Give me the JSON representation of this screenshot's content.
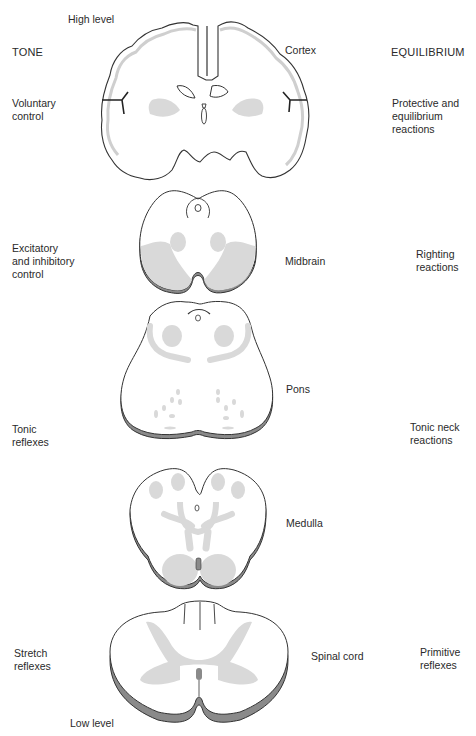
{
  "diagram": {
    "columns": {
      "left_header": "TONE",
      "right_header": "EQUILIBRIUM"
    },
    "axis": {
      "top": "High level",
      "bottom": "Low level"
    },
    "levels": [
      {
        "structure": "Cortex",
        "tone": "Voluntary\ncontrol",
        "equilibrium": "Protective and\nequilibrium\nreactions"
      },
      {
        "structure": "Midbrain",
        "tone": "Excitatory\nand inhibitory\ncontrol",
        "equilibrium": "Righting\nreactions"
      },
      {
        "structure": "Pons",
        "tone": "Tonic\nreflexes",
        "equilibrium": "Tonic neck\nreactions"
      },
      {
        "structure": "Medulla",
        "tone": "",
        "equilibrium": ""
      },
      {
        "structure": "Spinal cord",
        "tone": "Stretch\nreflexes",
        "equilibrium": "Primitive\nreflexes"
      }
    ],
    "colors": {
      "outline": "#333333",
      "gray_matter": "#d9d9d9",
      "rim": "#8a8a8a",
      "background": "#ffffff"
    }
  }
}
